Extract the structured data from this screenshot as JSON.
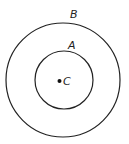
{
  "diagram": {
    "type": "concentric-circles",
    "center": {
      "label": "C",
      "x": 59.5,
      "y": 81
    },
    "circles": [
      {
        "name": "outer",
        "label": "B",
        "cx": 63,
        "cy": 80,
        "r": 57
      },
      {
        "name": "inner",
        "label": "A",
        "cx": 64,
        "cy": 80,
        "r": 29
      }
    ],
    "labels": {
      "outer": "B",
      "inner": "A",
      "center": "C"
    },
    "stroke_color": "#222222",
    "background": "#ffffff"
  }
}
